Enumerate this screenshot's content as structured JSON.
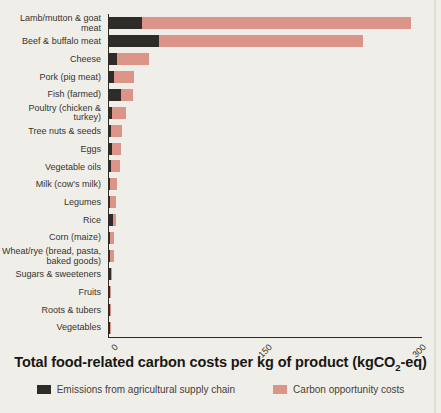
{
  "title": {
    "prefix": "Total food-related carbon costs per kg of product (kgCO",
    "subscript": "2",
    "suffix": "-eq)"
  },
  "legend": {
    "items": [
      {
        "label": "Emissions from agricultural supply chain",
        "colorKey": "emissions"
      },
      {
        "label": "Carbon opportunity costs",
        "colorKey": "opportunity"
      }
    ]
  },
  "colors": {
    "emissions": "#2f2b29",
    "opportunity": "#dd9488",
    "background": "#f0eee8",
    "axis": "#2e2b27",
    "text": "#37332d"
  },
  "chart_data": {
    "type": "bar",
    "orientation": "horizontal",
    "stacked": true,
    "title": "Total food-related carbon costs per kg of product (kgCO2-eq)",
    "xlabel": "",
    "ylabel": "",
    "xlim": [
      0,
      300
    ],
    "x_ticks": [
      0,
      150,
      300
    ],
    "grid": false,
    "legend_position": "bottom",
    "categories": [
      "Lamb/mutton & goat meat",
      "Beef & buffalo meat",
      "Cheese",
      "Pork (pig meat)",
      "Fish (farmed)",
      "Poultry (chicken & turkey)",
      "Tree nuts & seeds",
      "Eggs",
      "Vegetable oils",
      "Milk (cow's milk)",
      "Legumes",
      "Rice",
      "Corn (maize)",
      "Wheat/rye (bread, pasta, baked goods)",
      "Sugars & sweeteners",
      "Fruits",
      "Roots & tubers",
      "Vegetables"
    ],
    "series": [
      {
        "name": "Emissions from agricultural supply chain",
        "values": [
          32,
          49,
          8,
          5,
          12,
          3,
          1.5,
          2.5,
          1.5,
          1,
          1,
          4,
          1,
          1,
          2,
          0.5,
          0.5,
          0.5
        ]
      },
      {
        "name": "Carbon opportunity costs",
        "values": [
          262,
          198,
          31,
          19,
          11,
          14,
          11,
          9.5,
          9.5,
          6.5,
          5.5,
          2.5,
          4,
          3.5,
          1,
          1,
          1,
          0.7
        ]
      }
    ]
  }
}
